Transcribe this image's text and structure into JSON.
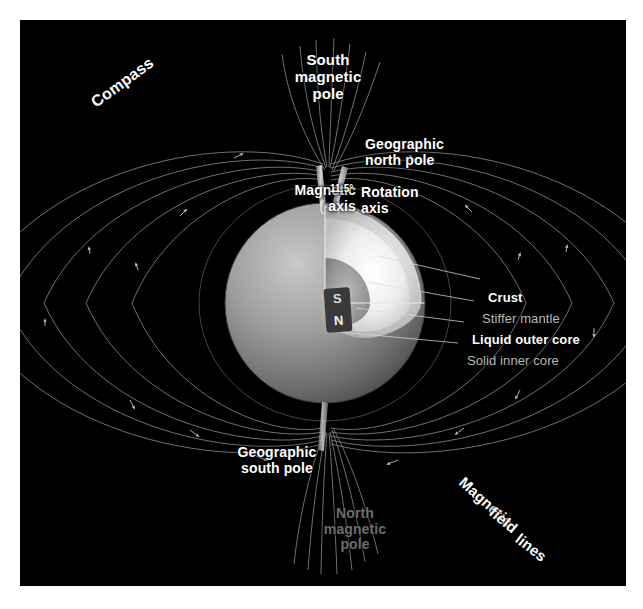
{
  "figure": {
    "background_color": "#000000",
    "frame_color": "#ffffff"
  },
  "labels": {
    "south_magnetic_pole": "South\nmagnetic\npole",
    "compass": "Compass",
    "geographic_north_pole": "Geographic\nnorth pole",
    "magnetic_axis": "Magnetic\naxis",
    "tilt_angle": "11.5°",
    "rotation_axis": "Rotation\naxis",
    "crust": "Crust",
    "stiffer_mantle": "Stiffer mantle",
    "liquid_outer_core": "Liquid outer core",
    "solid_inner_core": "Solid inner core",
    "geographic_south_pole": "Geographic\nsouth pole",
    "north_magnetic_pole": "North\nmagnetic\npole",
    "magnetic_field_lines_1": "Magnetic",
    "magnetic_field_lines_2": "field",
    "magnetic_field_lines_3": "lines"
  },
  "magnet": {
    "south_pole_letter": "S",
    "north_pole_letter": "N",
    "body_color": "#3a3a3a"
  },
  "colors": {
    "field_line": "#9a9a9a",
    "leader_line": "#d8d8d8",
    "earth_surface": "#8e8e8e",
    "earth_interior_bright": "#f2f2f2",
    "label_white": "#ffffff",
    "label_gray": "#b9b9b9",
    "label_dim": "#6d6d6d"
  },
  "earth": {
    "center_x": 325,
    "center_y": 300,
    "radius": 100,
    "layers": [
      "Crust",
      "Stiffer mantle",
      "Liquid outer core",
      "Solid inner core"
    ]
  }
}
